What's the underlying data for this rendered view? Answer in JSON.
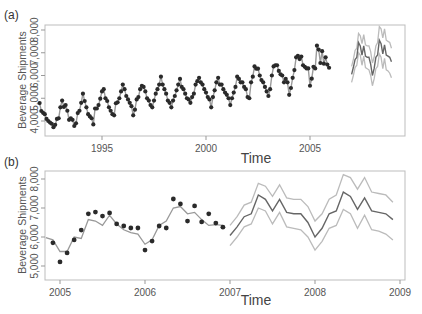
{
  "chart_data": [
    {
      "panel": "(a)",
      "type": "line",
      "title": "",
      "xlabel": "Time",
      "ylabel": "Beverage Shipments",
      "xlim": [
        1992.0,
        2009.3
      ],
      "ylim": [
        3600,
        8200
      ],
      "x_ticks": [
        1995,
        2000,
        2005
      ],
      "y_ticks": [
        4000,
        5000,
        6000,
        7000,
        8000
      ],
      "y_tick_labels": [
        "4,000",
        "5,000",
        "6,000",
        "7,000",
        "8,000"
      ],
      "grid": false,
      "legend": null,
      "series": [
        {
          "name": "Observed",
          "style": "points",
          "color": "#2a2a2a",
          "start": 1992.0,
          "step": 0.0833333,
          "values": [
            4790,
            4440,
            4360,
            4300,
            4090,
            4000,
            3930,
            3880,
            3730,
            3830,
            4090,
            4120,
            4600,
            4900,
            4620,
            4700,
            4450,
            4050,
            4120,
            4050,
            3780,
            3900,
            4350,
            4450,
            4800,
            5200,
            4880,
            4600,
            4300,
            4200,
            4120,
            3850,
            4550,
            4550,
            4700,
            4980,
            5300,
            5400,
            5000,
            4880,
            4600,
            4450,
            4300,
            4250,
            4780,
            4820,
            5000,
            5300,
            5600,
            5400,
            5100,
            4950,
            4800,
            4650,
            4250,
            4500,
            4950,
            5050,
            5400,
            5550,
            5500,
            5300,
            5000,
            4900,
            4700,
            4600,
            4900,
            5200,
            5400,
            5600,
            5950,
            5600,
            5400,
            5200,
            4900,
            4800,
            4600,
            4900,
            5100,
            5350,
            5600,
            5850,
            5500,
            5400,
            5200,
            5000,
            4950,
            4800,
            5050,
            5200,
            5600,
            5750,
            5900,
            5700,
            5600,
            5400,
            5250,
            5050,
            4950,
            4600,
            5050,
            5350,
            5700,
            5900,
            5600,
            5600,
            5400,
            5250,
            5150,
            5000,
            4700,
            5000,
            5250,
            5500,
            5950,
            5850,
            5700,
            5700,
            5500,
            5400,
            5050,
            5000,
            5700,
            5950,
            6400,
            6300,
            6300,
            6000,
            5800,
            5700,
            5500,
            5300,
            5100,
            5400,
            6000,
            6400,
            6450,
            6450,
            6200,
            6050,
            6000,
            5700,
            5850,
            5700,
            5150,
            5450,
            5900,
            6240,
            6800,
            6860,
            6720,
            6830,
            6450,
            6380,
            6310,
            6310,
            5550,
            5860,
            6380,
            6310,
            7310,
            7140,
            6550,
            7070,
            6520,
            6800,
            6480,
            6340
          ]
        },
        {
          "name": "Forecast",
          "style": "line",
          "color": "#666666",
          "start": 2007.0,
          "step": 0.0833333,
          "values": [
            6050,
            6350,
            6700,
            6800,
            7450,
            7300,
            6900,
            7300,
            6850,
            6800,
            6800,
            6500,
            6000,
            6300,
            6800,
            6900,
            7550,
            7400,
            6950,
            7350,
            6900,
            6850,
            6800,
            6600
          ]
        },
        {
          "name": "Upper bound",
          "style": "line",
          "color": "#bbbbbb",
          "start": 2007.0,
          "step": 0.0833333,
          "values": [
            6400,
            6700,
            7100,
            7200,
            7850,
            7750,
            7400,
            7800,
            7350,
            7300,
            7300,
            7050,
            6550,
            6800,
            7300,
            7450,
            8150,
            8050,
            7650,
            8050,
            7550,
            7500,
            7450,
            7200
          ]
        },
        {
          "name": "Lower bound",
          "style": "line",
          "color": "#bbbbbb",
          "start": 2007.0,
          "step": 0.0833333,
          "values": [
            5700,
            6000,
            6350,
            6450,
            7000,
            6900,
            6450,
            6850,
            6350,
            6300,
            6250,
            6000,
            5550,
            5850,
            6300,
            6400,
            6950,
            6800,
            6300,
            6750,
            6250,
            6200,
            6100,
            5900
          ]
        }
      ]
    },
    {
      "panel": "(b)",
      "type": "line",
      "title": "",
      "xlabel": "Time",
      "ylabel": "Beverage Shipments",
      "xlim": [
        2004.83,
        2009.0
      ],
      "ylim": [
        4600,
        8300
      ],
      "x_ticks": [
        2005,
        2006,
        2007,
        2008,
        2009
      ],
      "y_ticks": [
        5000,
        6000,
        7000,
        8000
      ],
      "y_tick_labels": [
        "5,000",
        "6,000",
        "7,000",
        "8,000"
      ],
      "grid": false,
      "legend": null,
      "series": [
        {
          "name": "Observed",
          "style": "points",
          "color": "#2a2a2a",
          "start": 2004.9167,
          "step": 0.0833333,
          "values": [
            5800,
            5140,
            5450,
            5900,
            6240,
            6800,
            6860,
            6720,
            6830,
            6450,
            6380,
            6310,
            6310,
            5550,
            5860,
            6380,
            6310,
            7310,
            7140,
            6550,
            7070,
            6520,
            6800,
            6480,
            6340
          ]
        },
        {
          "name": "Fitted",
          "style": "line",
          "color": "#999999",
          "start": 2004.8333,
          "step": 0.0833333,
          "values": [
            5980,
            5900,
            5500,
            5500,
            6000,
            5950,
            6600,
            6550,
            6400,
            6750,
            6450,
            6250,
            6150,
            6100,
            5750,
            5900,
            6400,
            6550,
            7000,
            7050,
            6800,
            6850,
            6600,
            6400,
            6430,
            6400
          ]
        },
        {
          "name": "Forecast",
          "style": "line",
          "color": "#666666",
          "start": 2007.0,
          "step": 0.0833333,
          "values": [
            6050,
            6350,
            6700,
            6800,
            7450,
            7300,
            6900,
            7300,
            6850,
            6800,
            6800,
            6500,
            6000,
            6300,
            6800,
            6900,
            7550,
            7400,
            6950,
            7350,
            6900,
            6850,
            6800,
            6600
          ]
        },
        {
          "name": "Upper bound",
          "style": "line",
          "color": "#bbbbbb",
          "start": 2007.0,
          "step": 0.0833333,
          "values": [
            6400,
            6700,
            7100,
            7200,
            7850,
            7750,
            7400,
            7800,
            7350,
            7300,
            7300,
            7050,
            6550,
            6800,
            7300,
            7450,
            8150,
            8050,
            7650,
            8050,
            7550,
            7500,
            7450,
            7200
          ]
        },
        {
          "name": "Lower bound",
          "style": "line",
          "color": "#bbbbbb",
          "start": 2007.0,
          "step": 0.0833333,
          "values": [
            5700,
            6000,
            6350,
            6450,
            7000,
            6900,
            6450,
            6850,
            6350,
            6300,
            6250,
            6000,
            5550,
            5850,
            6300,
            6400,
            6950,
            6800,
            6300,
            6750,
            6250,
            6200,
            6100,
            5900
          ]
        }
      ]
    }
  ],
  "panels": {
    "a": {
      "label": "(a)",
      "ylabel": "Beverage Shipments",
      "xlabel": "Time",
      "x_tick_labels": [
        "1995",
        "2000",
        "2005"
      ],
      "y_tick_labels": [
        "4,000",
        "5,000",
        "6,000",
        "7,000",
        "8,000"
      ]
    },
    "b": {
      "label": "(b)",
      "ylabel": "Beverage Shipments",
      "xlabel": "Time",
      "x_tick_labels": [
        "2005",
        "2006",
        "2007",
        "2008",
        "2009"
      ],
      "y_tick_labels": [
        "5,000",
        "6,000",
        "7,000",
        "8,000"
      ]
    }
  }
}
